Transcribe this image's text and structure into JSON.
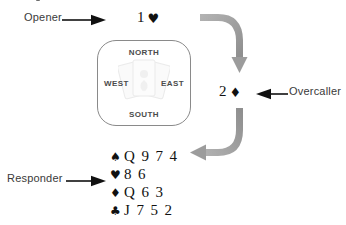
{
  "diagram": {
    "colors": {
      "flow_arrow": "#9a9a9a",
      "flow_arrow_dark": "#8e8e8e",
      "pointer_arrow": "#111111",
      "box_border": "#8a8a8a",
      "text": "#3a3a3a",
      "bid_text": "#111111",
      "compass_text": "#4b4b4b"
    }
  },
  "labels": {
    "opener": "Opener",
    "responder": "Responder",
    "overcaller": "Overcaller"
  },
  "bids": {
    "opener": {
      "rank": "1",
      "suit": "♥",
      "suit_name": "hearts",
      "full": "1 ♥"
    },
    "overcaller": {
      "rank": "2",
      "suit": "♦",
      "suit_name": "diamonds",
      "full": "2 ♦"
    }
  },
  "compass": {
    "north": "NORTH",
    "south": "SOUTH",
    "west": "WEST",
    "east": "EAST"
  },
  "hand": {
    "owner": "Responder",
    "rows": [
      {
        "suit_symbol": "♠",
        "suit_name": "spades",
        "cards": "Q 9 7 4"
      },
      {
        "suit_symbol": "♥",
        "suit_name": "hearts",
        "cards": "8 6"
      },
      {
        "suit_symbol": "♦",
        "suit_name": "diamonds",
        "cards": "Q 6 3"
      },
      {
        "suit_symbol": "♣",
        "suit_name": "clubs",
        "cards": "J 7 5 2"
      }
    ]
  },
  "icons": {
    "opener_pointer": "arrow-right-icon",
    "responder_pointer": "arrow-right-icon",
    "overcaller_pointer": "arrow-left-icon",
    "flow_down": "curved-arrow-down-icon",
    "flow_back": "curved-arrow-left-icon",
    "watermark": "playing-cards-fan-icon"
  }
}
